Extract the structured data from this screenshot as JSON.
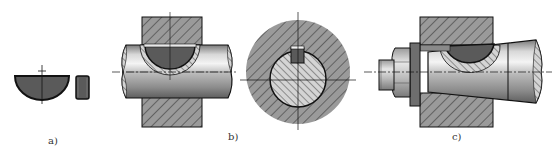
{
  "figure": {
    "subfigures": [
      {
        "id": "a",
        "label": "a)",
        "description": "half-moon key front and side view"
      },
      {
        "id": "b",
        "label": "b)",
        "description": "half-moon key in cylindrical shaft with hub, longitudinal and cross section"
      },
      {
        "id": "c",
        "label": "c)",
        "description": "half-moon key in tapered shaft end with washer and nut"
      }
    ]
  },
  "colors": {
    "key_fill": "#5a5a5a",
    "hatch_bg": "#9a9a9a",
    "hatch_line": "#2a2a2a",
    "outline": "#111111",
    "shaft_light": "#f0f0f0",
    "shaft_dark": "#8a8a8a"
  }
}
